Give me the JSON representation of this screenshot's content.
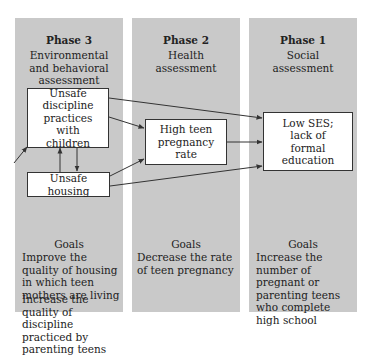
{
  "phases": [
    {
      "title": "Phase 3",
      "subtitle": "Environmental and behavioral assessment",
      "subtitle_lines": [
        "Environmental",
        "and behavioral",
        "assessment"
      ],
      "goals_label": "Goals",
      "goals": [
        "Improve the quality of housing in which teen mothers are living",
        "Increase the quality of discipline practiced by parenting teens"
      ]
    },
    {
      "title": "Phase 2",
      "subtitle": "Health assessment",
      "subtitle_lines": [
        "Health",
        "assessment"
      ],
      "goals_label": "Goals",
      "goals": [
        "Decrease the rate of teen pregnancy"
      ]
    },
    {
      "title": "Phase 1",
      "subtitle": "Social assessment",
      "subtitle_lines": [
        "Social",
        "assessment"
      ],
      "goals_label": "Goals",
      "goals": [
        "Increase the number of pregnant or parenting teens who complete high school"
      ]
    }
  ],
  "nodes": {
    "unsafe_discipline": "Unsafe discipline practices with children",
    "unsafe_housing": "Unsafe housing",
    "high_teen_pregnancy": "High teen pregnancy rate",
    "low_ses": "Low SES; lack of formal education"
  },
  "edges": [
    {
      "from": "external",
      "to": "unsafe_discipline"
    },
    {
      "from": "unsafe_discipline",
      "to": "unsafe_housing"
    },
    {
      "from": "unsafe_housing",
      "to": "unsafe_discipline"
    },
    {
      "from": "unsafe_discipline",
      "to": "high_teen_pregnancy"
    },
    {
      "from": "unsafe_housing",
      "to": "high_teen_pregnancy"
    },
    {
      "from": "unsafe_discipline",
      "to": "low_ses"
    },
    {
      "from": "high_teen_pregnancy",
      "to": "low_ses"
    },
    {
      "from": "unsafe_housing",
      "to": "low_ses"
    }
  ],
  "colors": {
    "panel": "#c9c9c9",
    "box": "#ffffff",
    "line": "#333333"
  }
}
